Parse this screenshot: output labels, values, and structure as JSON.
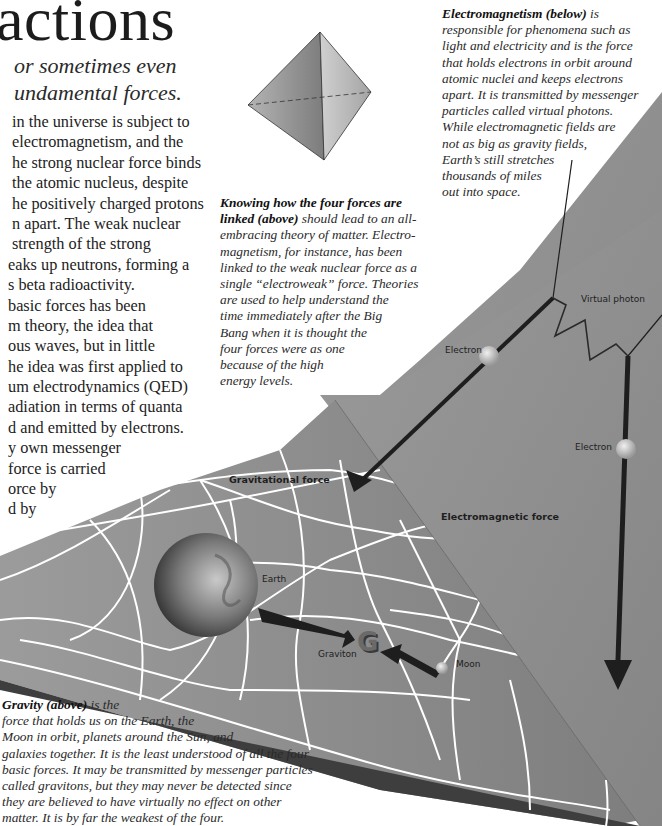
{
  "page": {
    "title": "actions",
    "intro_lines": [
      "or sometimes even",
      "undamental forces."
    ],
    "body_lines": [
      " in the universe is subject to",
      " electromagnetism, and the",
      "he strong nuclear force binds",
      " the atomic nucleus, despite",
      "he positively charged protons",
      "n apart. The weak nuclear",
      " strength of the strong",
      "eaks up neutrons, forming a",
      "s beta radioactivity.",
      " basic forces has been",
      "m theory, the idea that",
      "ous waves, but in little",
      "he idea was first applied to",
      "um electrodynamics (QED)",
      "adiation in terms of quanta",
      "d and emitted by electrons.",
      "y own messenger",
      " force is carried",
      "orce by",
      "d by"
    ]
  },
  "captions": {
    "linked": {
      "bold": "Knowing how the four forces are linked (above)",
      "lines": [
        {
          "b": "Knowing how the four forces are",
          "t": ""
        },
        {
          "b": "linked (above)",
          "t": " should lead to an all-"
        },
        {
          "b": "",
          "t": "embracing theory of matter. Electro-"
        },
        {
          "b": "",
          "t": "magnetism, for instance, has been"
        },
        {
          "b": "",
          "t": "linked to the weak nuclear force as a"
        },
        {
          "b": "",
          "t": "single “electroweak” force. Theories"
        },
        {
          "b": "",
          "t": "are used to help understand the"
        },
        {
          "b": "",
          "t": "time immediately after the Big"
        },
        {
          "b": "",
          "t": "Bang when it is thought the"
        },
        {
          "b": "",
          "t": "four forces were as one"
        },
        {
          "b": "",
          "t": "because of the high"
        },
        {
          "b": "",
          "t": "energy levels."
        }
      ]
    },
    "electromagnetism": {
      "lines": [
        {
          "b": "Electromagnetism (below)",
          "t": " is"
        },
        {
          "b": "",
          "t": "responsible for phenomena such as"
        },
        {
          "b": "",
          "t": "light and electricity and is the force"
        },
        {
          "b": "",
          "t": "that holds electrons in orbit around"
        },
        {
          "b": "",
          "t": "atomic nuclei and keeps electrons"
        },
        {
          "b": "",
          "t": "apart. It is transmitted by messenger"
        },
        {
          "b": "",
          "t": "particles called virtual photons."
        },
        {
          "b": "",
          "t": "While electromagnetic fields are"
        },
        {
          "b": "",
          "t": "not as big as gravity fields,"
        },
        {
          "b": "",
          "t": "Earth’s still stretches"
        },
        {
          "b": "",
          "t": "thousands of miles"
        },
        {
          "b": "",
          "t": "out into space."
        }
      ]
    },
    "gravity": {
      "lines": [
        {
          "b": "Gravity (above)",
          "t": " is the"
        },
        {
          "b": "",
          "t": "force that holds us on the Earth, the"
        },
        {
          "b": "",
          "t": "Moon in orbit, planets around the Sun, and"
        },
        {
          "b": "",
          "t": "galaxies together. It is the least understood of all the four"
        },
        {
          "b": "",
          "t": "basic forces. It may be transmitted by messenger particles"
        },
        {
          "b": "",
          "t": "called gravitons, but they may never be detected since"
        },
        {
          "b": "",
          "t": "they are believed to have virtually no effect on other"
        },
        {
          "b": "",
          "t": "matter. It is by far the weakest of the four."
        }
      ]
    }
  },
  "diagram": {
    "labels": {
      "virtual_photon": "Virtual photon",
      "electron_1": "Electron",
      "electron_2": "Electron",
      "electromagnetic_force": "Electromagnetic force",
      "gravitational_force": "Gravitational force",
      "earth": "Earth",
      "graviton": "Graviton",
      "graviton_glyph": "G",
      "moon": "Moon"
    },
    "colors": {
      "em_plane": "#8c8c8c",
      "grav_plane": "#8a8a8a",
      "grid_lines": "#ffffff",
      "arrows": "#1e1e1e",
      "tetrahedron": "#a8a8a8"
    }
  }
}
